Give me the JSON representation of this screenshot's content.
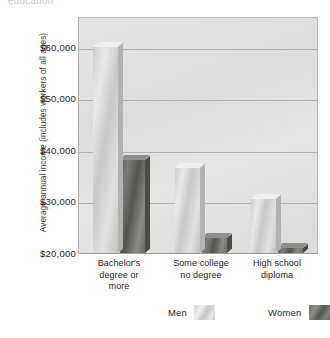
{
  "top_caption": "education",
  "chart_data": {
    "type": "bar",
    "title": "",
    "xlabel": "",
    "ylabel": "Average annual income (includes workers of all ages)",
    "categories": [
      "Bachelor's\ndegree or\nmore",
      "Some college\nno degree",
      "High school\ndiploma"
    ],
    "category_lines": [
      [
        "Bachelor's",
        "degree or",
        "more"
      ],
      [
        "Some college",
        "no degree"
      ],
      [
        "High school",
        "diploma"
      ]
    ],
    "series": [
      {
        "name": "Men",
        "values": [
          60000,
          36500,
          30500
        ]
      },
      {
        "name": "Women",
        "values": [
          38000,
          23000,
          21000
        ]
      }
    ],
    "ylim": [
      20000,
      66000
    ],
    "yticks": [
      60000,
      50000,
      40000,
      30000,
      20000
    ],
    "ytick_labels": [
      "$60,000",
      "$50,000",
      "$40,000",
      "$30,000",
      "$20,000"
    ],
    "grid": true,
    "legend_position": "bottom",
    "colors": {
      "men": "#d8d7d5",
      "women": "#6e6e6a",
      "plot_background": "#e0dfdd",
      "gridline": "#a9a9a7"
    }
  },
  "legend": {
    "items": [
      {
        "label": "Men",
        "swatch": "men-swatch"
      },
      {
        "label": "Women",
        "swatch": "women-swatch"
      }
    ]
  }
}
